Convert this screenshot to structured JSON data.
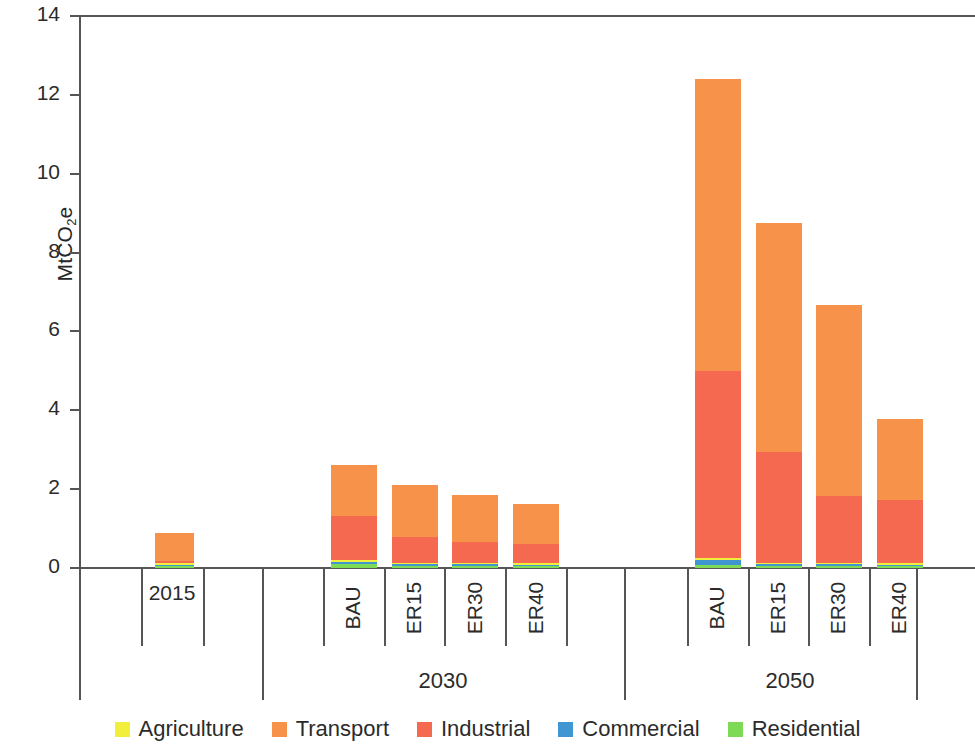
{
  "chart_data": {
    "type": "bar",
    "subtype": "stacked-bar-grouped",
    "title": "",
    "xlabel": "",
    "ylabel": "MtCO2e",
    "ylabel_display": "MtCO",
    "ylabel_sub": "2",
    "ylabel_tail": "e",
    "ylim": [
      0,
      14
    ],
    "ytick_values": [
      0,
      2,
      4,
      6,
      8,
      10,
      12,
      14
    ],
    "ytick_labels": [
      "0",
      "2",
      "4",
      "6",
      "8",
      "10",
      "12",
      "14"
    ],
    "grid": false,
    "legend_position": "bottom",
    "groups": [
      {
        "label": "2015",
        "label_rotated": false,
        "categories": [
          "2015"
        ]
      },
      {
        "label": "2030",
        "label_rotated": true,
        "categories": [
          "BAU",
          "ER15",
          "ER30",
          "ER40"
        ]
      },
      {
        "label": "2050",
        "label_rotated": true,
        "categories": [
          "BAU",
          "ER15",
          "ER30",
          "ER40"
        ]
      }
    ],
    "categories": [
      "2015",
      "BAU",
      "ER15",
      "ER30",
      "ER40",
      "BAU",
      "ER15",
      "ER30",
      "ER40"
    ],
    "series": [
      {
        "name": "Agriculture",
        "color": "#f2ee3c",
        "values": [
          0.01,
          0.01,
          0.01,
          0.01,
          0.01,
          0.01,
          0.01,
          0.01,
          0.01
        ]
      },
      {
        "name": "Transport",
        "color": "#f7924a",
        "values": [
          0.73,
          1.3,
          1.32,
          1.21,
          1.0,
          7.4,
          5.82,
          4.85,
          2.07
        ]
      },
      {
        "name": "Industrial",
        "color": "#f4694f",
        "values": [
          0.04,
          1.12,
          0.65,
          0.52,
          0.49,
          4.75,
          2.8,
          1.7,
          1.6
        ]
      },
      {
        "name": "Commercial",
        "color": "#3f96d1",
        "values": [
          0.01,
          0.07,
          0.04,
          0.04,
          0.03,
          0.14,
          0.05,
          0.05,
          0.04
        ]
      },
      {
        "name": "Residential",
        "color": "#7ed957",
        "values": [
          0.05,
          0.09,
          0.06,
          0.05,
          0.05,
          0.07,
          0.05,
          0.04,
          0.04
        ]
      }
    ],
    "totals": [
      0.84,
      2.58,
      2.06,
      1.81,
      1.57,
      12.35,
      8.72,
      6.63,
      3.75
    ],
    "annotations": []
  },
  "legend": {
    "items": [
      {
        "label": "Agriculture",
        "color": "#f2ee3c"
      },
      {
        "label": "Transport",
        "color": "#f7924a"
      },
      {
        "label": "Industrial",
        "color": "#f4694f"
      },
      {
        "label": "Commercial",
        "color": "#3f96d1"
      },
      {
        "label": "Residential",
        "color": "#7ed957"
      }
    ]
  },
  "axis_colors": {
    "line": "#555555",
    "text": "#2b2b2b"
  }
}
